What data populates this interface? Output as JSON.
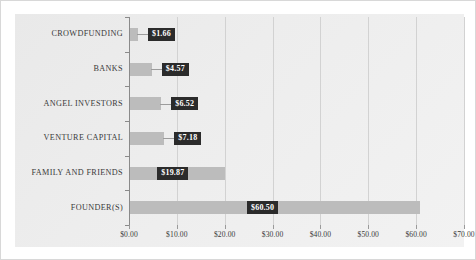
{
  "chart_data": {
    "type": "bar",
    "orientation": "horizontal",
    "title": "",
    "xlabel": "",
    "ylabel": "",
    "categories": [
      "CROWDFUNDING",
      "BANKS",
      "ANGEL INVESTORS",
      "VENTURE CAPITAL",
      "FAMILY AND FRIENDS",
      "FOUNDER(S)"
    ],
    "values": [
      1.66,
      4.57,
      6.52,
      7.18,
      19.87,
      60.5
    ],
    "data_labels": [
      "$1.66",
      "$4.57",
      "$6.52",
      "$7.18",
      "$19.87",
      "$60.50"
    ],
    "xlim": [
      0,
      70
    ],
    "xticks": [
      0,
      10,
      20,
      30,
      40,
      50,
      60,
      70
    ],
    "xtick_labels": [
      "$0.00",
      "$10.00",
      "$20.00",
      "$30.00",
      "$40.00",
      "$50.00",
      "$60.00",
      "$70.00"
    ],
    "grid": "vertical",
    "legend": "none",
    "colors": {
      "bar": "#bcbcbc",
      "label_box_bg": "#2b2b2b",
      "label_box_text": "#ffffff",
      "gridline": "#d2d2d2",
      "axis": "#8a8a8a",
      "plot_background": "#ededed",
      "page_background": "#ffffff",
      "category_text": "#3a3a3a",
      "tick_text": "#3a3a3a"
    }
  }
}
